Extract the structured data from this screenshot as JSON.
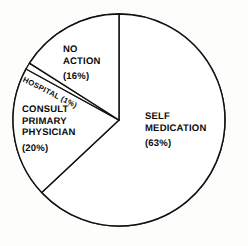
{
  "chart_data": {
    "type": "pie",
    "title": "",
    "subtitle": "",
    "xlabel": "",
    "ylabel": "",
    "legend_position": "none",
    "grid": false,
    "start_angle_deg": 0,
    "direction": "clockwise",
    "categories": [
      "SELF MEDICATION",
      "CONSULT PRIMARY PHYSICIAN",
      "HOSPITAL",
      "NO ACTION"
    ],
    "values": [
      63,
      20,
      1,
      16
    ],
    "units": "percent",
    "slices": [
      {
        "name": "SELF MEDICATION",
        "label_lines": [
          "SELF",
          "MEDICATION"
        ],
        "value": 63,
        "percent_text": "(63%)",
        "fill": "#ffffff",
        "stroke": "#111111"
      },
      {
        "name": "CONSULT PRIMARY PHYSICIAN",
        "label_lines": [
          "CONSULT",
          "PRIMARY",
          "PHYSICIAN"
        ],
        "value": 20,
        "percent_text": "(20%)",
        "fill": "#ffffff",
        "stroke": "#111111"
      },
      {
        "name": "HOSPITAL",
        "label_lines": [
          "HOSPITAL (1%)"
        ],
        "value": 1,
        "percent_text": "(1%)",
        "fill": "#ffffff",
        "stroke": "#111111"
      },
      {
        "name": "NO ACTION",
        "label_lines": [
          "NO",
          "ACTION"
        ],
        "value": 16,
        "percent_text": "(16%)",
        "fill": "#ffffff",
        "stroke": "#111111"
      }
    ]
  },
  "labels": {
    "no_action": {
      "line1": "NO",
      "line2": "ACTION",
      "percent": "(16%)"
    },
    "self_medication": {
      "line1": "SELF",
      "line2": "MEDICATION",
      "percent": "(63%)"
    },
    "consult": {
      "line1": "CONSULT",
      "line2": "PRIMARY",
      "line3": "PHYSICIAN",
      "percent": "(20%)"
    },
    "hospital": {
      "text": "HOSPITAL (1%)"
    }
  },
  "style": {
    "background": "#fdfdfb",
    "stroke": "#111111",
    "slice_fill": "#ffffff",
    "text_color": "#0b0b0b"
  },
  "geometry": {
    "center_x": 119,
    "center_y": 120,
    "radius": 106
  }
}
